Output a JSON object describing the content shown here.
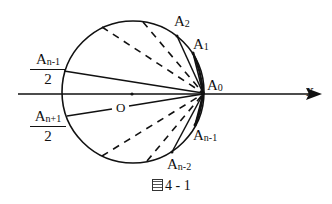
{
  "figure": {
    "caption_prefix_glyph": "圖",
    "caption_number": "4 - 1",
    "axis_label": "x",
    "center_label": "O",
    "points": {
      "A0": {
        "base": "A",
        "sub": "0"
      },
      "A1": {
        "base": "A",
        "sub": "1"
      },
      "A2": {
        "base": "A",
        "sub": "2"
      },
      "An_minus_1": {
        "base": "A",
        "sub": "n-1"
      },
      "An_minus_2": {
        "base": "A",
        "sub": "n-2"
      }
    },
    "fractions": {
      "upper": {
        "num_base": "A",
        "num_sub": "n-1",
        "den": "2"
      },
      "lower": {
        "num_base": "A",
        "num_sub": "n+1",
        "den": "2"
      }
    },
    "geometry": {
      "circle": {
        "cx": 133,
        "cy": 92,
        "r": 71
      },
      "axis": {
        "x1": 18,
        "x2": 318,
        "y": 94
      },
      "A0": [
        203,
        93
      ],
      "colors": {
        "stroke": "#111111",
        "background": "#ffffff"
      }
    }
  }
}
